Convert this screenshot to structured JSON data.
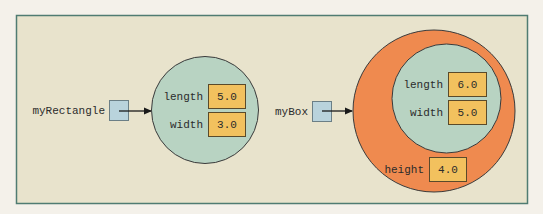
{
  "diagram": {
    "colors": {
      "panel_bg": "#e8e3cc",
      "panel_border": "#4f7c72",
      "object_fill": "#b8d3c2",
      "outer_object_fill": "#ef8a4f",
      "field_box_fill": "#f2c15e",
      "reference_box_fill": "#b9d3dc"
    },
    "rectangle": {
      "variable": "myRectangle",
      "fields": [
        {
          "name": "length",
          "value": "5.0"
        },
        {
          "name": "width",
          "value": "3.0"
        }
      ]
    },
    "box": {
      "variable": "myBox",
      "inherited_fields": [
        {
          "name": "length",
          "value": "6.0"
        },
        {
          "name": "width",
          "value": "5.0"
        }
      ],
      "own_fields": [
        {
          "name": "height",
          "value": "4.0"
        }
      ]
    }
  }
}
